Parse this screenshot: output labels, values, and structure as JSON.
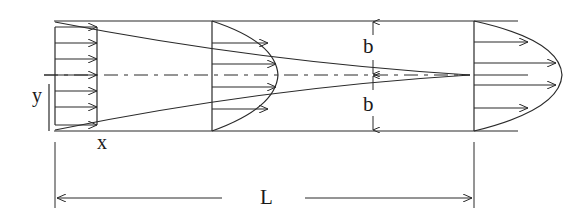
{
  "diagram": {
    "colors": {
      "stroke": "#2a2a2a",
      "background": "#ffffff"
    },
    "labels": {
      "y_axis": "y",
      "x_axis": "x",
      "half_width_top": "b",
      "half_width_bottom": "b",
      "entrance_length": "L"
    },
    "stations": [
      {
        "name": "inlet",
        "profile": "uniform",
        "arrow_count": 7
      },
      {
        "name": "developing",
        "profile": "blunted-parabolic",
        "arrow_count": 4
      },
      {
        "name": "fully-developed",
        "profile": "parabolic",
        "arrow_count": 4
      }
    ]
  }
}
